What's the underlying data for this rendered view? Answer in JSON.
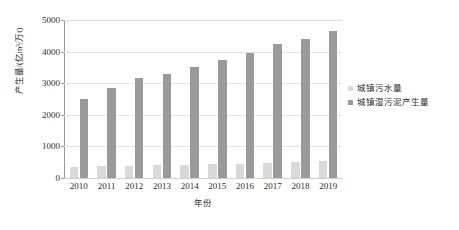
{
  "chart_data": {
    "type": "bar",
    "title": "",
    "subtitle": "",
    "xlabel": "年份",
    "ylabel": "产生量/(亿m³/万t)",
    "categories": [
      "2010",
      "2011",
      "2012",
      "2013",
      "2014",
      "2015",
      "2016",
      "2017",
      "2018",
      "2019"
    ],
    "series": [
      {
        "name": "城镇污水量",
        "color": "#d9d9d9",
        "values": [
          355,
          375,
          390,
          405,
          420,
          440,
          455,
          480,
          520,
          550
        ]
      },
      {
        "name": "城镇湿污泥产生量",
        "color": "#9a9a9a",
        "values": [
          2500,
          2850,
          3150,
          3300,
          3500,
          3750,
          3950,
          4250,
          4400,
          4650
        ]
      }
    ],
    "ylim": [
      0,
      5000
    ],
    "y_ticks": [
      "0",
      "1000",
      "2000",
      "3000",
      "4000",
      "5000"
    ],
    "y_tick_values": [
      0,
      1000,
      2000,
      3000,
      4000,
      5000
    ],
    "grid": "horizontal",
    "legend_position": "right"
  },
  "legend": {
    "entries": [
      {
        "label": "城镇污水量"
      },
      {
        "label": "城镇湿污泥产生量"
      }
    ]
  },
  "axes": {
    "y_title": "产生量/(亿m³/万t)",
    "x_title": "年份"
  }
}
